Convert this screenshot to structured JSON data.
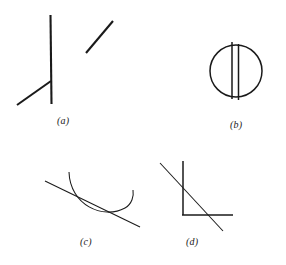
{
  "page": {
    "background_color": "#ffffff",
    "ink_color": "#1a1a1a",
    "width": 286,
    "height": 265
  },
  "figures": [
    {
      "id": "a",
      "label": "(a)",
      "name": "vertical-line-with-oblique-and-detached-segment",
      "parts": [
        {
          "name": "vertical-line",
          "type": "line",
          "x1": 50.5,
          "y1": 15,
          "x2": 51.5,
          "y2": 104,
          "weight": "thick"
        },
        {
          "name": "oblique-line",
          "type": "line",
          "x1": 17,
          "y1": 105,
          "x2": 51,
          "y2": 81,
          "weight": "thick"
        },
        {
          "name": "detached-diagonal-segment",
          "type": "line",
          "x1": 86,
          "y1": 53,
          "x2": 113,
          "y2": 21,
          "weight": "thick"
        }
      ]
    },
    {
      "id": "b",
      "label": "(b)",
      "name": "circle-with-two-parallel-vertical-chords",
      "parts": [
        {
          "name": "circle-outline",
          "type": "circle",
          "cx": 236,
          "cy": 71,
          "r": 26,
          "weight": "med"
        },
        {
          "name": "left-vertical-chord",
          "type": "line",
          "x1": 232,
          "y1": 42,
          "x2": 232,
          "y2": 99,
          "weight": "med"
        },
        {
          "name": "right-vertical-chord",
          "type": "line",
          "x1": 238.5,
          "y1": 44,
          "x2": 238.5,
          "y2": 100,
          "weight": "med"
        }
      ]
    },
    {
      "id": "c",
      "label": "(c)",
      "name": "concave-arc-crossed-by-straight-line",
      "parts": [
        {
          "name": "u-shaped-arc",
          "type": "path",
          "d": "M 69 172 C 70 205, 103 220, 125 208 C 132 204, 134 196, 133 190",
          "weight": "thin"
        },
        {
          "name": "straight-diagonal-line",
          "type": "line",
          "x1": 45,
          "y1": 181,
          "x2": 140,
          "y2": 227,
          "weight": "thin"
        }
      ]
    },
    {
      "id": "d",
      "label": "(d)",
      "name": "right-angle-corner-crossed-by-diagonal",
      "parts": [
        {
          "name": "vertical-arm",
          "type": "line",
          "x1": 183,
          "y1": 161,
          "x2": 183,
          "y2": 215,
          "weight": "med"
        },
        {
          "name": "horizontal-arm",
          "type": "line",
          "x1": 182,
          "y1": 215,
          "x2": 233,
          "y2": 215,
          "weight": "med"
        },
        {
          "name": "diagonal-line",
          "type": "line",
          "x1": 160,
          "y1": 163,
          "x2": 223,
          "y2": 231,
          "weight": "thin"
        }
      ]
    }
  ]
}
